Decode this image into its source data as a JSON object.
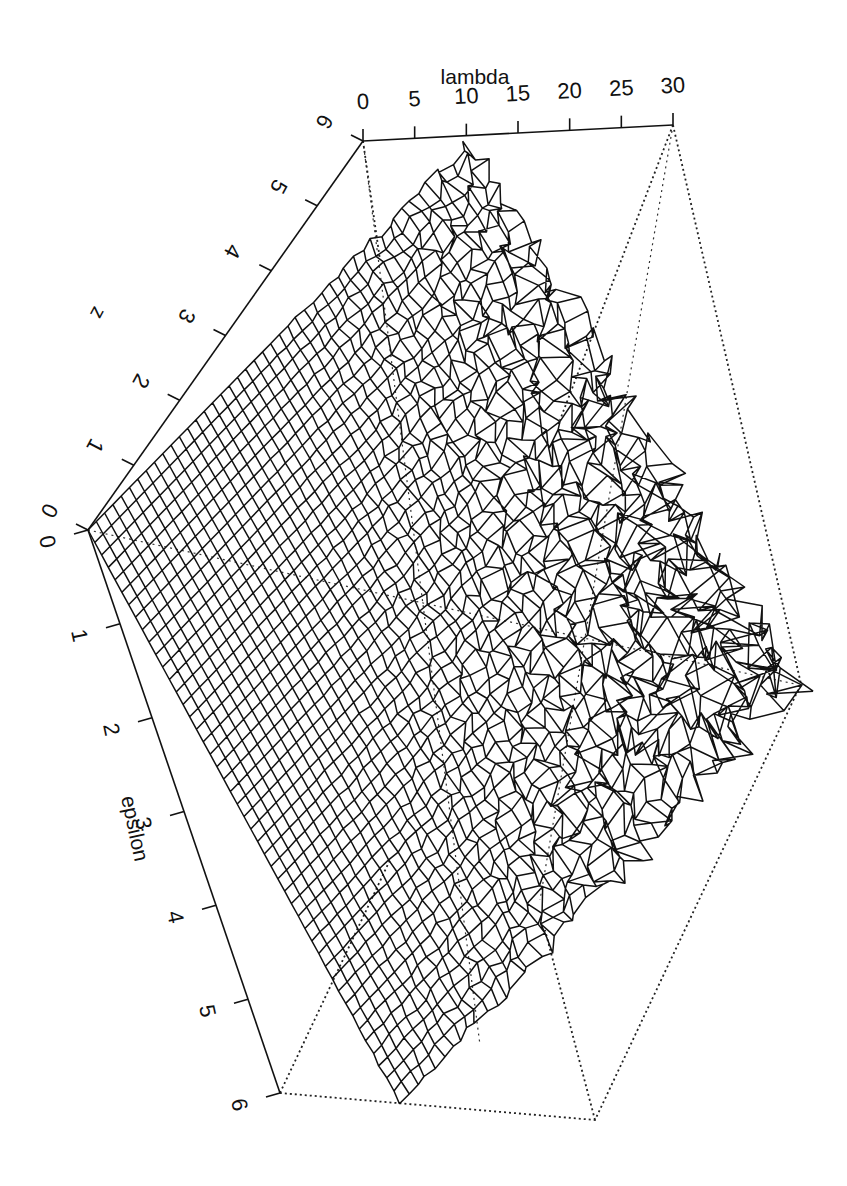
{
  "chart_data": {
    "type": "surface3d",
    "title": "",
    "render_style": "wireframe mesh, perspective view, rotated page",
    "axes": {
      "lambda": {
        "label": "lambda",
        "range": [
          0,
          30
        ],
        "ticks": [
          "0",
          "5",
          "10",
          "15",
          "20",
          "25",
          "30"
        ]
      },
      "z": {
        "label": "z",
        "range": [
          0,
          6
        ],
        "ticks": [
          "0",
          "1",
          "2",
          "3",
          "4",
          "5",
          "6"
        ]
      },
      "epsilon": {
        "label": "epsilon",
        "range": [
          0,
          6
        ],
        "ticks": [
          "0",
          "1",
          "2",
          "3",
          "4",
          "5",
          "6"
        ]
      }
    },
    "surface_samples": {
      "epsilon": [
        0,
        1,
        2,
        3,
        4,
        5,
        6
      ],
      "lambda": [
        0,
        5,
        10,
        15,
        20,
        25,
        30
      ],
      "z_approx": [
        [
          0.0,
          0.0,
          0.0,
          0.0,
          0.0,
          0.0,
          0.0
        ],
        [
          0.2,
          0.6,
          1.0,
          1.3,
          1.5,
          1.7,
          1.9
        ],
        [
          0.4,
          1.1,
          1.8,
          2.3,
          2.7,
          3.0,
          3.2
        ],
        [
          0.6,
          1.5,
          2.4,
          3.1,
          3.6,
          4.0,
          4.3
        ],
        [
          0.8,
          1.8,
          2.9,
          3.7,
          4.3,
          4.8,
          5.1
        ],
        [
          1.0,
          2.1,
          3.3,
          4.2,
          4.9,
          5.4,
          5.7
        ],
        [
          1.1,
          2.3,
          3.6,
          4.6,
          5.3,
          5.8,
          6.0
        ]
      ]
    }
  },
  "labels": {
    "lambda_title": "lambda",
    "z_title": "z",
    "epsilon_title": "epsilon",
    "lambda_ticks": [
      "0",
      "5",
      "10",
      "15",
      "20",
      "25",
      "30"
    ],
    "z_ticks": [
      "0",
      "1",
      "2",
      "3",
      "4",
      "5",
      "6"
    ],
    "epsilon_ticks": [
      "0",
      "1",
      "2",
      "3",
      "4",
      "5",
      "6"
    ]
  }
}
